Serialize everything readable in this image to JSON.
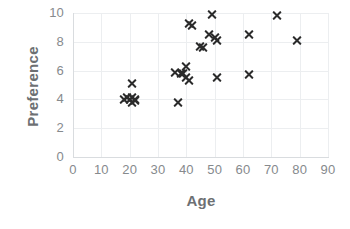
{
  "chart_data": {
    "type": "scatter",
    "title": "",
    "xlabel": "Age",
    "ylabel": "Preference",
    "xlim": [
      0,
      90
    ],
    "ylim": [
      0,
      10
    ],
    "xticks": [
      0,
      10,
      20,
      30,
      40,
      50,
      60,
      70,
      80,
      90
    ],
    "yticks": [
      0,
      2,
      4,
      6,
      8,
      10
    ],
    "xtick_labels": [
      "0",
      "10",
      "20",
      "30",
      "40",
      "50",
      "60",
      "70",
      "80",
      "90"
    ],
    "ytick_labels": [
      "0",
      "2",
      "4",
      "6",
      "8",
      "10"
    ],
    "grid": true,
    "legend": null,
    "marker": "x",
    "marker_color": "#2b2b2b",
    "series": [
      {
        "name": "Age vs Preference",
        "points": [
          {
            "x": 18,
            "y": 4.0
          },
          {
            "x": 19,
            "y": 4.1
          },
          {
            "x": 20,
            "y": 4.0
          },
          {
            "x": 21,
            "y": 4.1
          },
          {
            "x": 21,
            "y": 3.8
          },
          {
            "x": 21,
            "y": 5.1
          },
          {
            "x": 22,
            "y": 4.0
          },
          {
            "x": 22,
            "y": 3.9
          },
          {
            "x": 36,
            "y": 5.9
          },
          {
            "x": 37,
            "y": 3.8
          },
          {
            "x": 38,
            "y": 5.8
          },
          {
            "x": 39,
            "y": 5.8
          },
          {
            "x": 40,
            "y": 6.3
          },
          {
            "x": 40,
            "y": 5.5
          },
          {
            "x": 41,
            "y": 5.3
          },
          {
            "x": 41,
            "y": 9.3
          },
          {
            "x": 42,
            "y": 9.1
          },
          {
            "x": 45,
            "y": 7.7
          },
          {
            "x": 46,
            "y": 7.6
          },
          {
            "x": 48,
            "y": 8.5
          },
          {
            "x": 49,
            "y": 9.9
          },
          {
            "x": 50,
            "y": 8.3
          },
          {
            "x": 51,
            "y": 8.1
          },
          {
            "x": 51,
            "y": 5.5
          },
          {
            "x": 62,
            "y": 5.7
          },
          {
            "x": 62,
            "y": 8.5
          },
          {
            "x": 72,
            "y": 9.8
          },
          {
            "x": 79,
            "y": 8.1
          }
        ]
      }
    ]
  },
  "colors": {
    "marker": "#2b2b2b",
    "grid": "#eceef0",
    "axis": "#d9dcdf",
    "tick_text": "#868a8d",
    "axis_title": "#6d7073",
    "background": "#ffffff"
  }
}
